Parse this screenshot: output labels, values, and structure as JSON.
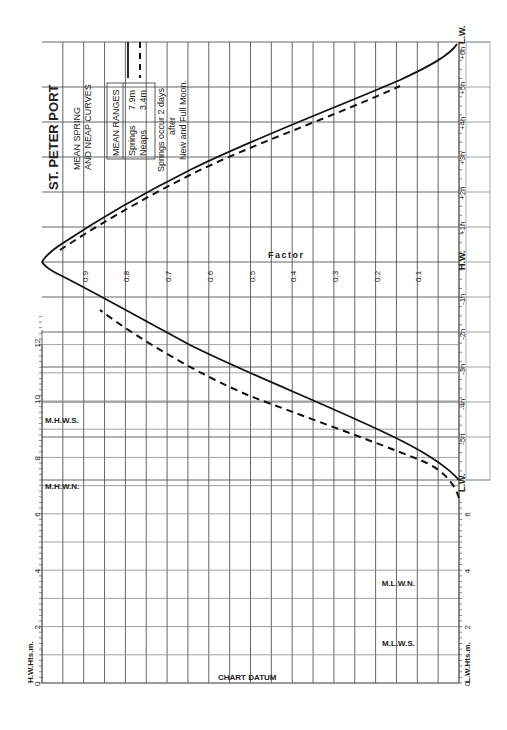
{
  "title": "ST. PETER PORT",
  "subtitle_line1": "MEAN SPRING",
  "subtitle_line2": "AND NEAP CURVES",
  "ranges": {
    "header": "MEAN RANGES",
    "springs_label": "Springs",
    "springs_value": "7.9m",
    "neaps_label": "Neaps",
    "neaps_value": "3.4m"
  },
  "note_line1": "Springs occur 2 days",
  "note_line2": "after",
  "note_line3": "New and Full Moon.",
  "factor_label": "Factor",
  "chart_datum_label": "CHART DATUM",
  "hw_axis_label": "H.W.Hts.m.",
  "lw_axis_label": "L.W.Hts.m.",
  "levels": {
    "mhws": "M.H.W.S.",
    "mhwn": "M.H.W.N.",
    "mlwn": "M.L.W.N.",
    "mlws": "M.L.W.S."
  },
  "hw_height_ticks": [
    "0",
    "2",
    "4",
    "6",
    "8",
    "10",
    "12"
  ],
  "lw_height_ticks": [
    "0",
    "2",
    "4",
    "6"
  ],
  "factor_ticks": [
    "0.9",
    "0.8",
    "0.7",
    "0.6",
    "0.5",
    "0.4",
    "0.3",
    "0.2",
    "0.1"
  ],
  "time_ticks": [
    "L.W.",
    "-5h",
    "-4h",
    "-3h",
    "-2h",
    "-1h",
    "H.W.",
    "+1h",
    "+2h",
    "+3h",
    "+4h",
    "+5h",
    "+6h",
    "L.W."
  ],
  "chart_data": {
    "type": "line",
    "xlabel": "Hours relative to High Water",
    "ylabel": "Factor",
    "x": [
      -6,
      -5,
      -4,
      -3,
      -2,
      -1,
      0,
      1,
      2,
      3,
      4,
      5,
      6
    ],
    "series": [
      {
        "name": "Springs (7.9m)",
        "style": "solid",
        "values": [
          0.0,
          0.08,
          0.3,
          0.55,
          0.78,
          0.95,
          1.0,
          0.93,
          0.76,
          0.52,
          0.27,
          0.08,
          0.0
        ]
      },
      {
        "name": "Neaps (3.4m)",
        "style": "dashed",
        "values": [
          0.0,
          0.05,
          0.28,
          0.55,
          0.78,
          0.95,
          1.0,
          0.95,
          0.8,
          0.56,
          0.3,
          0.09,
          0.0
        ]
      }
    ],
    "ylim": [
      0,
      1
    ],
    "hw_heights_m": {
      "range": [
        0,
        13
      ],
      "MHWS": 9.3,
      "MHWN": 7.0
    },
    "lw_heights_m": {
      "range": [
        0,
        6.5
      ],
      "MLWN": 3.6,
      "MLWS": 1.4
    }
  }
}
